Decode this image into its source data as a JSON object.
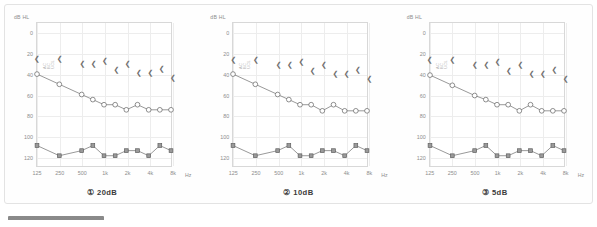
{
  "figure": {
    "title_fragment": "",
    "panel_count": 3
  },
  "chart_data": [
    {
      "type": "line",
      "title": "①  20dB",
      "xlabel": "Hz",
      "ylabel": "dB HL",
      "x_unit": "Hz",
      "y_unit": "dB HL",
      "xticks": [
        "125",
        "250",
        "500",
        "1k",
        "2k",
        "4k",
        "8k"
      ],
      "yticks": [
        "0",
        "20",
        "40",
        "60",
        "80",
        "100",
        "120"
      ],
      "ylim": [
        -10,
        130
      ],
      "xlim_octaves": [
        0,
        6
      ],
      "grid": true,
      "legend": [
        "AC",
        "BC",
        "UCL"
      ],
      "legend_position": "inside-top-left",
      "series": [
        {
          "name": "AC",
          "marker": "circle",
          "x_octave": [
            0,
            1,
            2,
            2.5,
            3,
            3.5,
            4,
            4.5,
            5,
            5.5,
            6
          ],
          "values": [
            40,
            50,
            60,
            65,
            70,
            70,
            75,
            70,
            75,
            75,
            75
          ]
        },
        {
          "name": "BC",
          "marker": "square",
          "x_octave": [
            0,
            1,
            2,
            2.5,
            3,
            3.5,
            4,
            4.5,
            5,
            5.5,
            6
          ],
          "values": [
            110,
            120,
            115,
            110,
            120,
            120,
            115,
            115,
            120,
            110,
            115
          ]
        },
        {
          "name": "UCL",
          "marker": "less-than",
          "x_octave": [
            0,
            1,
            2,
            2.5,
            3,
            3.5,
            4,
            4.5,
            5,
            5.5,
            6
          ],
          "values": [
            25,
            25,
            30,
            30,
            27,
            35,
            30,
            38,
            38,
            34,
            43
          ]
        }
      ]
    },
    {
      "type": "line",
      "title": "②  10dB",
      "xlabel": "Hz",
      "ylabel": "dB HL",
      "x_unit": "Hz",
      "y_unit": "dB HL",
      "xticks": [
        "125",
        "250",
        "500",
        "1k",
        "2k",
        "4k",
        "8k"
      ],
      "yticks": [
        "0",
        "20",
        "40",
        "60",
        "80",
        "100",
        "120"
      ],
      "ylim": [
        -10,
        130
      ],
      "xlim_octaves": [
        0,
        6
      ],
      "grid": true,
      "legend": [
        "AC",
        "BC",
        "UCL"
      ],
      "legend_position": "inside-top-left",
      "series": [
        {
          "name": "AC",
          "marker": "circle",
          "x_octave": [
            0,
            1,
            2,
            2.5,
            3,
            3.5,
            4,
            4.5,
            5,
            5.5,
            6
          ],
          "values": [
            40,
            50,
            60,
            65,
            70,
            70,
            76,
            70,
            76,
            76,
            76
          ]
        },
        {
          "name": "BC",
          "marker": "square",
          "x_octave": [
            0,
            1,
            2,
            2.5,
            3,
            3.5,
            4,
            4.5,
            5,
            5.5,
            6
          ],
          "values": [
            110,
            120,
            115,
            110,
            120,
            120,
            115,
            115,
            120,
            110,
            115
          ]
        },
        {
          "name": "UCL",
          "marker": "less-than",
          "x_octave": [
            0,
            1,
            2,
            2.5,
            3,
            3.5,
            4,
            4.5,
            5,
            5.5,
            6
          ],
          "values": [
            26,
            26,
            31,
            31,
            28,
            36,
            31,
            39,
            39,
            35,
            44
          ]
        }
      ]
    },
    {
      "type": "line",
      "title": "③  5dB",
      "xlabel": "Hz",
      "ylabel": "dB HL",
      "x_unit": "Hz",
      "y_unit": "dB HL",
      "xticks": [
        "125",
        "250",
        "500",
        "1k",
        "2k",
        "4k",
        "8k"
      ],
      "yticks": [
        "0",
        "20",
        "40",
        "60",
        "80",
        "100",
        "120"
      ],
      "ylim": [
        -10,
        130
      ],
      "xlim_octaves": [
        0,
        6
      ],
      "grid": true,
      "legend": [
        "AC",
        "BC",
        "UCL"
      ],
      "legend_position": "inside-top-left",
      "series": [
        {
          "name": "AC",
          "marker": "circle",
          "x_octave": [
            0,
            1,
            2,
            2.5,
            3,
            3.5,
            4,
            4.5,
            5,
            5.5,
            6
          ],
          "values": [
            41,
            51,
            61,
            65,
            70,
            70,
            76,
            70,
            76,
            76,
            76
          ]
        },
        {
          "name": "BC",
          "marker": "square",
          "x_octave": [
            0,
            1,
            2,
            2.5,
            3,
            3.5,
            4,
            4.5,
            5,
            5.5,
            6
          ],
          "values": [
            110,
            120,
            115,
            110,
            120,
            120,
            115,
            115,
            120,
            110,
            115
          ]
        },
        {
          "name": "UCL",
          "marker": "less-than",
          "x_octave": [
            0,
            1,
            2,
            2.5,
            3,
            3.5,
            4,
            4.5,
            5,
            5.5,
            6
          ],
          "values": [
            26,
            26,
            31,
            31,
            28,
            36,
            31,
            39,
            39,
            35,
            44
          ]
        }
      ]
    }
  ]
}
